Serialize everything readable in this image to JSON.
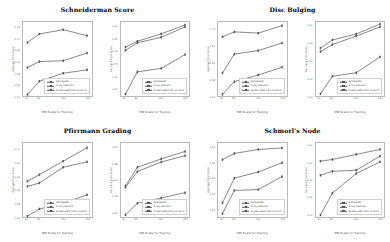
{
  "figure": {
    "width": 390,
    "height": 242,
    "background": "#ffffff"
  },
  "common": {
    "xlabel": "MRI Scans for Training",
    "xticks": [
      "40",
      "80",
      "160",
      "240"
    ],
    "legend_labels": [
      "SpineGAN",
      "X-ray pretrain",
      "Supervised from scratch"
    ],
    "series_color": "#555555"
  },
  "chart_data": [
    {
      "type": "line",
      "title": "Schneiderman Score",
      "panel": "top-left",
      "subplot": "left",
      "xlabel": "MRI Scans for Training",
      "ylabel": "Average Dice Score",
      "x": [
        40,
        80,
        160,
        240
      ],
      "xlim": [
        25,
        255
      ],
      "ylim": [
        0.5,
        0.76
      ],
      "yticks": [
        "0.50",
        "0.54",
        "0.58",
        "0.62",
        "0.66",
        "0.70",
        "0.74"
      ],
      "series": [
        {
          "name": "SpineGAN",
          "values": [
            0.688,
            0.718,
            0.733,
            0.712
          ]
        },
        {
          "name": "X-ray pretrain",
          "values": [
            0.6,
            0.621,
            0.624,
            0.651
          ]
        },
        {
          "name": "Supervised from scratch",
          "values": [
            0.505,
            0.552,
            0.58,
            0.592
          ]
        }
      ]
    },
    {
      "type": "line",
      "title": "Schneiderman Score",
      "panel": "top-left",
      "subplot": "right",
      "xlabel": "MRI Scans for Training",
      "ylabel": "Per-Case Dice Score",
      "x": [
        40,
        80,
        160,
        240
      ],
      "xlim": [
        25,
        255
      ],
      "ylim": [
        0.12,
        0.42
      ],
      "yticks": [
        "0.15",
        "0.20",
        "0.25",
        "0.30",
        "0.35",
        "0.40"
      ],
      "series": [
        {
          "name": "SpineGAN",
          "values": [
            0.318,
            0.342,
            0.372,
            0.408
          ]
        },
        {
          "name": "X-ray pretrain",
          "values": [
            0.305,
            0.336,
            0.358,
            0.4
          ]
        },
        {
          "name": "Supervised from scratch",
          "values": [
            0.128,
            0.218,
            0.232,
            0.288
          ]
        }
      ]
    },
    {
      "type": "line",
      "title": "Disc Bulging",
      "panel": "top-right",
      "subplot": "left",
      "xlabel": "MRI Scans for Training",
      "ylabel": "Average Dice Score",
      "x": [
        40,
        80,
        160,
        240
      ],
      "xlim": [
        25,
        255
      ],
      "ylim": [
        0.4,
        0.76
      ],
      "yticks": [
        "0.40",
        "0.48",
        "0.56",
        "0.64",
        "0.72"
      ],
      "series": [
        {
          "name": "SpineGAN",
          "values": [
            0.688,
            0.712,
            0.706,
            0.742
          ]
        },
        {
          "name": "X-ray pretrain",
          "values": [
            0.512,
            0.604,
            0.621,
            0.658
          ]
        },
        {
          "name": "Supervised from scratch",
          "values": [
            0.408,
            0.47,
            0.502,
            0.54
          ]
        }
      ]
    },
    {
      "type": "line",
      "title": "Disc Bulging",
      "panel": "top-right",
      "subplot": "right",
      "xlabel": "MRI Scans for Training",
      "ylabel": "Per-Case Dice Score",
      "x": [
        40,
        80,
        160,
        240
      ],
      "xlim": [
        25,
        255
      ],
      "ylim": [
        0.1,
        0.52
      ],
      "yticks": [
        "0.10",
        "0.20",
        "0.30",
        "0.40",
        "0.50"
      ],
      "series": [
        {
          "name": "SpineGAN",
          "values": [
            0.372,
            0.418,
            0.452,
            0.508
          ]
        },
        {
          "name": "X-ray pretrain",
          "values": [
            0.352,
            0.392,
            0.44,
            0.492
          ]
        },
        {
          "name": "Supervised from scratch",
          "values": [
            0.112,
            0.212,
            0.232,
            0.322
          ]
        }
      ]
    },
    {
      "type": "line",
      "title": "Pfirrmann Grading",
      "panel": "bottom-left",
      "subplot": "left",
      "xlabel": "MRI Scans for Training",
      "ylabel": "Average Dice Score",
      "x": [
        40,
        80,
        160,
        240
      ],
      "xlim": [
        25,
        255
      ],
      "ylim": [
        0.3,
        0.74
      ],
      "yticks": [
        "0.30",
        "0.38",
        "0.46",
        "0.54",
        "0.62",
        "0.70"
      ],
      "series": [
        {
          "name": "SpineGAN",
          "values": [
            0.512,
            0.552,
            0.632,
            0.712
          ]
        },
        {
          "name": "X-ray pretrain",
          "values": [
            0.482,
            0.502,
            0.596,
            0.628
          ]
        },
        {
          "name": "Supervised from scratch",
          "values": [
            0.305,
            0.348,
            0.382,
            0.432
          ]
        }
      ]
    },
    {
      "type": "line",
      "title": "Pfirrmann Grading",
      "panel": "bottom-left",
      "subplot": "right",
      "xlabel": "MRI Scans for Training",
      "ylabel": "Per-Case Dice Score",
      "x": [
        40,
        80,
        160,
        240
      ],
      "xlim": [
        25,
        255
      ],
      "ylim": [
        0.28,
        0.56
      ],
      "yticks": [
        "0.30",
        "0.36",
        "0.42",
        "0.48",
        "0.54"
      ],
      "series": [
        {
          "name": "SpineGAN",
          "values": [
            0.398,
            0.468,
            0.5,
            0.528
          ]
        },
        {
          "name": "X-ray pretrain",
          "values": [
            0.392,
            0.452,
            0.488,
            0.512
          ]
        },
        {
          "name": "Supervised from scratch",
          "values": [
            0.288,
            0.332,
            0.352,
            0.372
          ]
        }
      ]
    },
    {
      "type": "line",
      "title": "Schmorl's Node",
      "panel": "bottom-right",
      "subplot": "left",
      "xlabel": "MRI Scans for Training",
      "ylabel": "Average Dice Score",
      "x": [
        40,
        80,
        160,
        240
      ],
      "xlim": [
        25,
        255
      ],
      "ylim": [
        0.2,
        0.68
      ],
      "yticks": [
        "0.25",
        "0.35",
        "0.45",
        "0.55",
        "0.65"
      ],
      "series": [
        {
          "name": "SpineGAN",
          "values": [
            0.572,
            0.612,
            0.638,
            0.648
          ]
        },
        {
          "name": "X-ray pretrain",
          "values": [
            0.292,
            0.452,
            0.492,
            0.552
          ]
        },
        {
          "name": "Supervised from scratch",
          "values": [
            0.222,
            0.372,
            0.378,
            0.462
          ]
        }
      ]
    },
    {
      "type": "line",
      "title": "Schmorl's Node",
      "panel": "bottom-right",
      "subplot": "right",
      "xlabel": "MRI Scans for Training",
      "ylabel": "Per-Case Dice Score",
      "x": [
        40,
        80,
        160,
        240
      ],
      "xlim": [
        25,
        255
      ],
      "ylim": [
        0.18,
        0.62
      ],
      "yticks": [
        "0.20",
        "0.30",
        "0.40",
        "0.50",
        "0.60"
      ],
      "series": [
        {
          "name": "SpineGAN",
          "values": [
            0.512,
            0.522,
            0.552,
            0.582
          ]
        },
        {
          "name": "X-ray pretrain",
          "values": [
            0.428,
            0.452,
            0.458,
            0.542
          ]
        },
        {
          "name": "Supervised from scratch",
          "values": [
            0.192,
            0.322,
            0.438,
            0.508
          ]
        }
      ]
    }
  ],
  "panels": [
    {
      "title": "Schneiderman Score",
      "charts": [
        0,
        1
      ]
    },
    {
      "title": "Disc Bulging",
      "charts": [
        2,
        3
      ]
    },
    {
      "title": "Pfirrmann Grading",
      "charts": [
        4,
        5
      ]
    },
    {
      "title": "Schmorl's Node",
      "charts": [
        6,
        7
      ]
    }
  ]
}
